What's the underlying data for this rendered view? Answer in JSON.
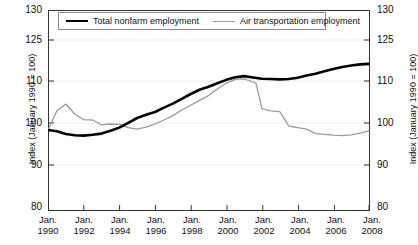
{
  "chart_data": {
    "type": "line",
    "title": "",
    "subtitle": "",
    "xlabel": "",
    "ylabel": "Index (January 1990 = 100)",
    "ylabel_right": "Index (January 1990 = 100)",
    "grid": false,
    "legend_position": "top-center-inside",
    "y_ticks": [
      130,
      125,
      110,
      100,
      90,
      80
    ],
    "y_tick_labels": [
      "130",
      "125",
      "110",
      "100",
      "90",
      "80"
    ],
    "ylim": [
      80,
      130
    ],
    "y_axis_note": "tick labels evenly spaced on the axis (non-linear spacing of values)",
    "x_ticks": [
      "Jan. 1990",
      "Jan. 1992",
      "Jan. 1994",
      "Jan. 1996",
      "Jan. 1998",
      "Jan. 2000",
      "Jan. 2002",
      "Jan. 2004",
      "Jan. 2006",
      "Jan. 2008"
    ],
    "x_tick_month": "Jan.",
    "x_tick_years": [
      "1990",
      "1992",
      "1994",
      "1996",
      "1998",
      "2000",
      "2002",
      "2004",
      "2006",
      "2008"
    ],
    "xlim": [
      "1990-01",
      "2008-01"
    ],
    "series": [
      {
        "name": "Total nonfarm employment",
        "color": "#000000",
        "width": 2.6,
        "x": [
          "1990-01",
          "1990-07",
          "1991-01",
          "1991-07",
          "1992-01",
          "1992-07",
          "1993-01",
          "1993-07",
          "1994-01",
          "1994-07",
          "1995-01",
          "1995-07",
          "1996-01",
          "1996-07",
          "1997-01",
          "1997-07",
          "1998-01",
          "1998-07",
          "1999-01",
          "1999-07",
          "2000-01",
          "2000-07",
          "2001-01",
          "2001-07",
          "2002-01",
          "2002-07",
          "2003-01",
          "2003-07",
          "2004-01",
          "2004-07",
          "2005-01",
          "2005-07",
          "2006-01",
          "2006-07",
          "2007-01",
          "2007-07",
          "2008-01"
        ],
        "values": [
          100.0,
          99.7,
          99.0,
          98.7,
          98.6,
          98.8,
          99.1,
          99.8,
          100.6,
          101.8,
          103.0,
          103.8,
          104.5,
          105.6,
          106.6,
          107.8,
          109.0,
          110.1,
          111.2,
          112.5,
          113.8,
          114.8,
          115.2,
          114.7,
          114.2,
          114.1,
          114.0,
          114.1,
          114.6,
          115.4,
          116.1,
          117.0,
          117.9,
          118.6,
          119.2,
          119.6,
          119.8
        ]
      },
      {
        "name": "Air transportation employment",
        "color": "#9a9a9a",
        "width": 1.3,
        "x": [
          "1990-01",
          "1990-07",
          "1991-01",
          "1991-07",
          "1992-01",
          "1992-07",
          "1993-01",
          "1993-07",
          "1994-01",
          "1994-07",
          "1995-01",
          "1995-07",
          "1996-01",
          "1996-07",
          "1997-01",
          "1997-07",
          "1998-01",
          "1998-07",
          "1999-01",
          "1999-07",
          "2000-01",
          "2000-07",
          "2001-01",
          "2001-07",
          "2001-09",
          "2002-01",
          "2002-07",
          "2003-01",
          "2003-07",
          "2004-01",
          "2004-07",
          "2005-01",
          "2005-07",
          "2006-01",
          "2006-07",
          "2007-01",
          "2007-07",
          "2008-01"
        ],
        "values": [
          100.0,
          104.8,
          106.5,
          104.0,
          102.6,
          102.5,
          101.3,
          101.5,
          101.4,
          100.6,
          100.2,
          100.7,
          101.5,
          102.5,
          103.6,
          105.0,
          106.2,
          107.4,
          108.6,
          110.4,
          112.6,
          114.0,
          114.2,
          113.0,
          112.5,
          105.3,
          104.8,
          104.6,
          101.0,
          100.6,
          100.2,
          99.1,
          98.9,
          98.7,
          98.6,
          98.8,
          99.2,
          99.8
        ]
      }
    ],
    "annotations": []
  },
  "legend": {
    "entries": [
      {
        "label": "Total nonfarm employment",
        "swatch": "thick-black-line"
      },
      {
        "label": "Air transportation employment",
        "swatch": "thin-gray-line"
      }
    ]
  },
  "axes": {
    "left_title": "Index (January 1990 = 100)",
    "right_title": "Index (January 1990 = 100)",
    "y_labels": [
      "130",
      "125",
      "110",
      "100",
      "90",
      "80"
    ],
    "x_labels": [
      {
        "month": "Jan.",
        "year": "1990"
      },
      {
        "month": "Jan.",
        "year": "1992"
      },
      {
        "month": "Jan.",
        "year": "1994"
      },
      {
        "month": "Jan.",
        "year": "1996"
      },
      {
        "month": "Jan.",
        "year": "1998"
      },
      {
        "month": "Jan.",
        "year": "2000"
      },
      {
        "month": "Jan.",
        "year": "2002"
      },
      {
        "month": "Jan.",
        "year": "2004"
      },
      {
        "month": "Jan.",
        "year": "2006"
      },
      {
        "month": "Jan.",
        "year": "2008"
      }
    ]
  },
  "colors": {
    "series_primary": "#000000",
    "series_secondary": "#9a9a9a",
    "axis": "#333333",
    "background": "#ffffff"
  }
}
